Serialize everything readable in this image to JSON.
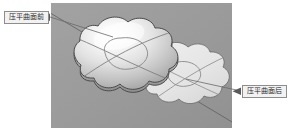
{
  "figure": {
    "type": "cad-3d-viewport-illustration",
    "background_color": "#ffffff",
    "viewport": {
      "name": "3d-modeling-viewport",
      "background_color": "#9a9a9a",
      "x": 51,
      "y": 3,
      "width": 181,
      "height": 125
    }
  },
  "callouts": [
    {
      "id": "before",
      "label": "压平曲面前",
      "box": {
        "x": 4,
        "y": 11,
        "width": 45,
        "height": 13
      },
      "fill": "#f2f2f2",
      "border": "#8d8d8d",
      "leader": {
        "from_x": 49,
        "from_y": 17,
        "to_x": 112,
        "to_y": 36
      },
      "arrow_at": "box"
    },
    {
      "id": "after",
      "label": "压平曲面后",
      "box": {
        "x": 242,
        "y": 85,
        "width": 45,
        "height": 13
      },
      "fill": "#f2f2f2",
      "border": "#8d8d8d",
      "leader": {
        "from_x": 242,
        "from_y": 91,
        "to_x": 186,
        "to_y": 79
      },
      "arrow_at": "box"
    }
  ],
  "shapes": [
    {
      "id": "domed-surface",
      "name": "blob-surface-bulged",
      "state": "before-flatten",
      "description": "cloud-shaped lofted surface with upward dome/bulge and specular highlight",
      "fill_light": "#fbfbfb",
      "fill_mid": "#d8d8d8",
      "fill_dark": "#9e9e9e",
      "outline": "#4a4a4a"
    },
    {
      "id": "flat-surface",
      "name": "blob-surface-flattened",
      "state": "after-flatten",
      "description": "same cloud-shaped outline, planar / no bulge, uniform light fill",
      "fill": "#e7e7e7",
      "outline": "#6a6a6a"
    }
  ],
  "construction": {
    "diagonal_line_color": "#5a5a5a",
    "isoparm_curve_color": "#7b7b7b",
    "inner_contour_color": "#8a8a8a"
  },
  "colors": {
    "page_bg": "#ffffff",
    "viewport_bg": "#9a9a9a",
    "callout_bg": "#f2f2f2",
    "callout_border": "#8d8d8d",
    "text": "#2a2a2a"
  }
}
